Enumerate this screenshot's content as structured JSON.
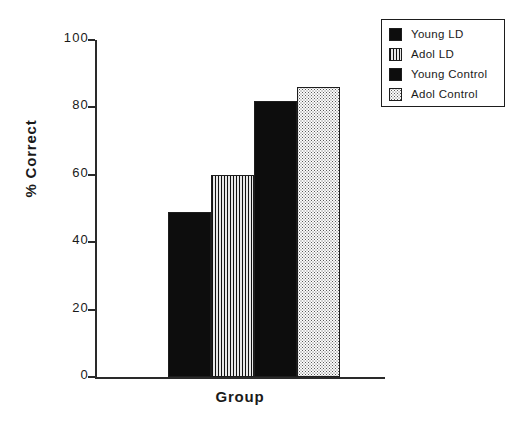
{
  "chart_data": {
    "type": "bar",
    "title": "",
    "xlabel": "Group",
    "ylabel": "% Correct",
    "categories": [
      "Young LD",
      "Adol LD",
      "Young  Control",
      "Adol  Control"
    ],
    "values": [
      49,
      60,
      82,
      86
    ],
    "ylim": [
      0,
      100
    ],
    "yticks": [
      0,
      20,
      40,
      60,
      80,
      100
    ],
    "ytick_labels": [
      "0",
      "20",
      "40",
      "60",
      "80",
      "100"
    ],
    "grid": false,
    "legend_position": "top-right",
    "series": [
      {
        "name": "Young LD",
        "value": 49,
        "fill": "solid-black",
        "color": "#0d0d0d"
      },
      {
        "name": "Adol LD",
        "value": 60,
        "fill": "vertical-stripes",
        "color": "#9a9a9a"
      },
      {
        "name": "Young  Control",
        "value": 82,
        "fill": "solid-black",
        "color": "#0d0d0d"
      },
      {
        "name": "Adol  Control",
        "value": 86,
        "fill": "fine-dots",
        "color": "#fbfbfb"
      }
    ]
  },
  "axes": {
    "y_label": "% Correct",
    "x_label": "Group",
    "y_ticks": [
      {
        "value": 100,
        "label": "100"
      },
      {
        "value": 80,
        "label": "80"
      },
      {
        "value": 60,
        "label": "60"
      },
      {
        "value": 40,
        "label": "40"
      },
      {
        "value": 20,
        "label": "20"
      },
      {
        "value": 0,
        "label": "0"
      }
    ],
    "axis_color": "#2a2a2a"
  },
  "legend": {
    "items": [
      {
        "label": "Young LD",
        "fill": "solid-black"
      },
      {
        "label": "Adol LD",
        "fill": "vertical-stripes"
      },
      {
        "label": "Young  Control",
        "fill": "solid-black"
      },
      {
        "label": "Adol  Control",
        "fill": "fine-dots"
      }
    ]
  }
}
